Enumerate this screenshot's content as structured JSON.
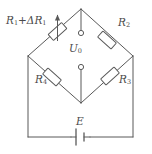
{
  "diagram": {
    "type": "wheatstone-bridge-circuit",
    "stroke_color": "#595959",
    "label_color": "#4a4a4a",
    "background": "#ffffff",
    "labels": {
      "r1": {
        "base": "R",
        "base_sub": "1",
        "operator": "+",
        "delta": "ΔR",
        "delta_sub": "1",
        "full": "R₁ + ΔR₁"
      },
      "r2": {
        "base": "R",
        "sub": "2",
        "full": "R₂"
      },
      "r3": {
        "base": "R",
        "sub": "3",
        "full": "R₃"
      },
      "r4": {
        "base": "R",
        "sub": "4",
        "full": "R₄"
      },
      "u0": {
        "base": "U",
        "sub": "0",
        "full": "U₀"
      },
      "e": {
        "base": "E",
        "full": "E"
      }
    },
    "components": {
      "variable_resistor": "R1 + dR1 arm with adjustment arrow",
      "resistor_r2": "top-right bridge arm",
      "resistor_r3": "bottom-right bridge arm",
      "resistor_r4": "bottom-left bridge arm",
      "battery": "E source on bottom wire",
      "output_terminals": "two open-circle terminals for U0"
    },
    "geometry": {
      "top_node": [
        81,
        9
      ],
      "left_node": [
        28,
        56
      ],
      "right_node": [
        133,
        56
      ],
      "bottom_node": [
        81,
        103
      ],
      "bottom_wire_y": 137
    }
  }
}
